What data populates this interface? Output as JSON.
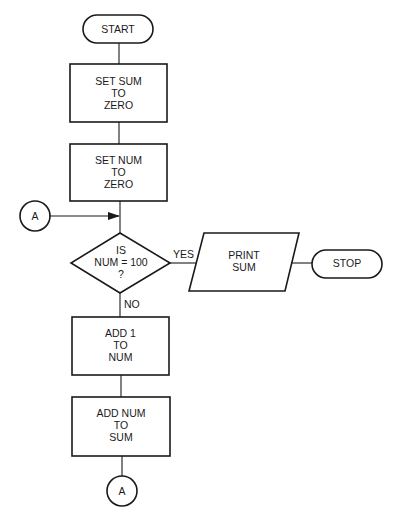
{
  "diagram": {
    "type": "flowchart",
    "colors": {
      "stroke": "#1a1a1a",
      "background": "#ffffff"
    },
    "nodes": {
      "start": {
        "shape": "terminal",
        "lines": [
          "START"
        ]
      },
      "set_sum": {
        "shape": "process",
        "lines": [
          "SET SUM",
          "TO",
          "ZERO"
        ]
      },
      "set_num": {
        "shape": "process",
        "lines": [
          "SET NUM",
          "TO",
          "ZERO"
        ]
      },
      "connector_in": {
        "shape": "connector",
        "lines": [
          "A"
        ]
      },
      "decision": {
        "shape": "decision",
        "lines": [
          "IS",
          "NUM = 100",
          "?"
        ]
      },
      "print_sum": {
        "shape": "io",
        "lines": [
          "PRINT",
          "SUM"
        ]
      },
      "stop": {
        "shape": "terminal",
        "lines": [
          "STOP"
        ]
      },
      "add_one": {
        "shape": "process",
        "lines": [
          "ADD 1",
          "TO",
          "NUM"
        ]
      },
      "add_num": {
        "shape": "process",
        "lines": [
          "ADD NUM",
          "TO",
          "SUM"
        ]
      },
      "connector_out": {
        "shape": "connector",
        "lines": [
          "A"
        ]
      }
    },
    "edges": {
      "yes_label": "YES",
      "no_label": "NO"
    }
  }
}
